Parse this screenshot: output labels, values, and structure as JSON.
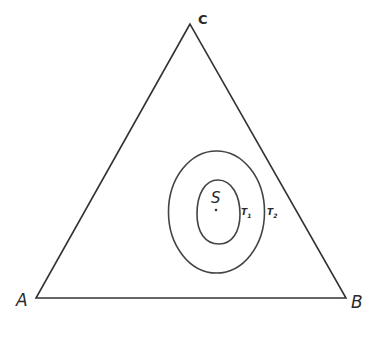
{
  "diagram": {
    "type": "ternary-triangle",
    "stroke_color": "#333333",
    "background": "#ffffff",
    "vertices": [
      {
        "id": "A",
        "label": "A"
      },
      {
        "id": "B",
        "label": "B"
      },
      {
        "id": "C",
        "label": "C"
      }
    ],
    "point": {
      "label": "S"
    },
    "contours": [
      {
        "label": "T",
        "subscript": "1",
        "kind": "inner"
      },
      {
        "label": "T",
        "subscript": "2",
        "kind": "outer"
      }
    ]
  }
}
